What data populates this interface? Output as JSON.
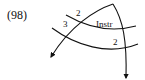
{
  "example": {
    "number": "(98)"
  },
  "diagram": {
    "labels": {
      "upper_left_top": "2",
      "upper_left_bottom": "3",
      "center": "Instr",
      "lower_right": "2"
    },
    "stroke_color": "#111111"
  }
}
